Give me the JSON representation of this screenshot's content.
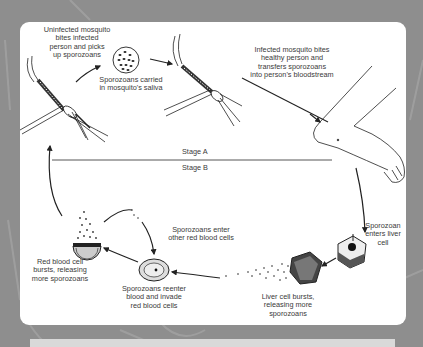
{
  "diagram": {
    "stages": {
      "a": "Stage A",
      "b": "Stage B"
    },
    "labels": {
      "uninfected_mosquito": "Uninfected mosquito\nbites infected\nperson and picks\nup sporozoans",
      "saliva": "Sporozoans carried\nin mosquito's saliva",
      "infected_mosquito": "Infected mosquito bites\nhealthy person and\ntransfers sporozoans\ninto person's bloodstream",
      "enters_liver": "Sporozoan\nenters liver cell",
      "liver_bursts": "Liver cell bursts,\nreleasing more\nsporozoans",
      "reenter_blood": "Sporozoans reenter\nblood and invade\nred blood cells",
      "rbc_bursts": "Red blood cell\nbursts, releasing\nmore sporozoans",
      "enter_other_rbc": "Sporozoans enter\nother red blood cells"
    },
    "colors": {
      "background": "#8e8e8e",
      "card": "#ffffff",
      "ink": "#2a2a2a"
    }
  }
}
